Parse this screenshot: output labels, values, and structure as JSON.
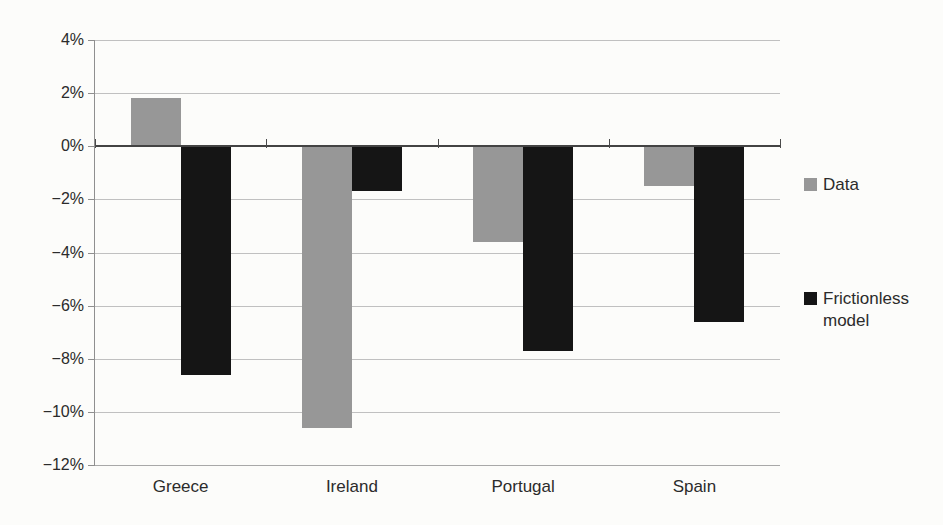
{
  "chart_data": {
    "type": "bar",
    "title": "",
    "xlabel": "",
    "ylabel": "",
    "categories": [
      "Greece",
      "Ireland",
      "Portugal",
      "Spain"
    ],
    "series": [
      {
        "name": "Data",
        "color": "#979797",
        "values": [
          1.8,
          -10.6,
          -3.6,
          -1.5
        ]
      },
      {
        "name": "Frictionless model",
        "color": "#151515",
        "values": [
          -8.6,
          -1.7,
          -7.7,
          -6.6
        ]
      }
    ],
    "ylim": [
      -12,
      4
    ],
    "ytick_step": 2,
    "ytick_labels": [
      "4%",
      "2%",
      "0%",
      "−2%",
      "−4%",
      "−6%",
      "−8%",
      "−10%",
      "−12%"
    ],
    "grid": true,
    "legend_position": "right"
  },
  "legend": {
    "items": [
      {
        "label": "Data",
        "color": "#979797"
      },
      {
        "label": "Frictionless model",
        "color": "#151515"
      }
    ]
  },
  "colors": {
    "background": "#fcfcfa",
    "gridline": "#c0c0c0",
    "zero_line": "#434343",
    "axis_line": "#8f8f8f",
    "text": "#2b2b2b"
  }
}
